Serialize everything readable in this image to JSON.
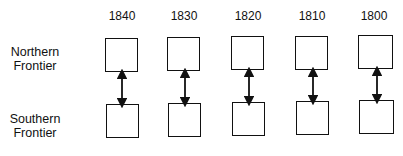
{
  "diagram": {
    "years": [
      "1840",
      "1830",
      "1820",
      "1810",
      "1800"
    ],
    "rows": [
      {
        "label_line1": "Northern",
        "label_line2": "Frontier"
      },
      {
        "label_line1": "Southern",
        "label_line2": "Frontier"
      }
    ],
    "connector": "double-headed-arrow"
  }
}
